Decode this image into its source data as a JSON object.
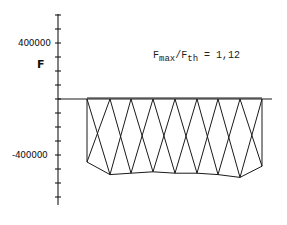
{
  "chart_data": {
    "type": "line",
    "title": "",
    "xlabel": "",
    "ylabel": "F",
    "annotation": {
      "main": "F",
      "sub1": "max",
      "slash": "/F",
      "sub2": "th",
      "value": " = 1,12"
    },
    "y_ticks": [
      {
        "value": 400000,
        "label": "400000"
      },
      {
        "value": -400000,
        "label": "-400000"
      }
    ],
    "ylim": [
      -700000,
      600000
    ],
    "y_tick_step": 100000,
    "grid": false,
    "top_points_x": [
      87,
      110,
      131,
      153,
      175,
      197,
      218,
      240,
      262
    ],
    "top_value": 0,
    "bottom_values": [
      -450000,
      -540000,
      -530000,
      -520000,
      -530000,
      -530000,
      -540000,
      -560000,
      -480000
    ]
  },
  "colors": {
    "line": "#1a1a1a",
    "background": "#ffffff"
  }
}
